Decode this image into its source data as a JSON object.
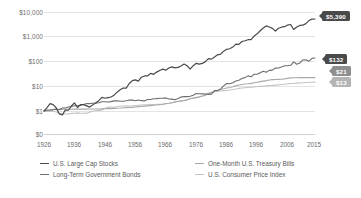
{
  "chart_data": {
    "type": "line",
    "title": "",
    "subtitle": "",
    "xlabel": "",
    "ylabel": "",
    "scale": "log",
    "ylim": [
      1,
      10000
    ],
    "xlim": [
      1926,
      2015
    ],
    "grid": true,
    "legend_position": "bottom",
    "y_ticks": [
      {
        "label": "$10,000",
        "value": 10000
      },
      {
        "label": "$1,000",
        "value": 1000
      },
      {
        "label": "$100",
        "value": 100
      },
      {
        "label": "$10",
        "value": 10
      },
      {
        "label": "$1",
        "value": 1
      },
      {
        "label": "$0",
        "value": 0
      }
    ],
    "x_ticks": [
      "1926",
      "1936",
      "1946",
      "1956",
      "1966",
      "1976",
      "1986",
      "1996",
      "2006",
      "2015"
    ],
    "x": [
      1926,
      1927,
      1928,
      1929,
      1930,
      1931,
      1932,
      1933,
      1934,
      1935,
      1936,
      1937,
      1938,
      1939,
      1940,
      1941,
      1942,
      1943,
      1944,
      1945,
      1946,
      1947,
      1948,
      1949,
      1950,
      1951,
      1952,
      1953,
      1954,
      1955,
      1956,
      1957,
      1958,
      1959,
      1960,
      1961,
      1962,
      1963,
      1964,
      1965,
      1966,
      1967,
      1968,
      1969,
      1970,
      1971,
      1972,
      1973,
      1974,
      1975,
      1976,
      1977,
      1978,
      1979,
      1980,
      1981,
      1982,
      1983,
      1984,
      1985,
      1986,
      1987,
      1988,
      1989,
      1990,
      1991,
      1992,
      1993,
      1994,
      1995,
      1996,
      1997,
      1998,
      1999,
      2000,
      2001,
      2002,
      2003,
      2004,
      2005,
      2006,
      2007,
      2008,
      2009,
      2010,
      2011,
      2012,
      2013,
      2014,
      2015
    ],
    "series": [
      {
        "name": "U.S. Large Cap Stocks",
        "color": "#4a4a4a",
        "end_value": 5390,
        "end_label": "$5,390",
        "values": [
          1,
          1.37,
          1.96,
          1.8,
          1.35,
          0.77,
          0.7,
          1.08,
          1.07,
          1.58,
          2.12,
          1.38,
          1.8,
          1.79,
          1.61,
          1.43,
          1.72,
          2.16,
          2.59,
          3.53,
          3.24,
          3.43,
          3.62,
          4.3,
          5.66,
          7.02,
          8.31,
          8.23,
          12.55,
          16.51,
          17.59,
          15.69,
          22.49,
          25.18,
          25.3,
          32.1,
          29.3,
          35.99,
          41.94,
          47.19,
          42.43,
          52.59,
          58.38,
          53.42,
          55.55,
          63.5,
          75.56,
          64.47,
          47.39,
          65.04,
          80.55,
          74.79,
          79.7,
          94.4,
          125.03,
          118.87,
          144.46,
          177.09,
          188.27,
          248.01,
          294.17,
          309.61,
          360.96,
          475.23,
          460.42,
          600.73,
          646.5,
          711.35,
          720.59,
          991.08,
          1218.54,
          1625.03,
          2089.4,
          2528.16,
          2298.03,
          2024.93,
          1577.62,
          2030.63,
          2251.63,
          2362.15,
          2735.28,
          2885.44,
          1817.83,
          2298.45,
          2644.27,
          2700.88,
          3132.93,
          4145.9,
          4712.33,
          4777.71
        ]
      },
      {
        "name": "Long-Term Government Bonds",
        "color": "#6e6e6e",
        "end_value": 132,
        "end_label": "$132",
        "values": [
          1,
          1.09,
          1.1,
          1.14,
          1.19,
          1.13,
          1.32,
          1.32,
          1.45,
          1.52,
          1.63,
          1.63,
          1.72,
          1.82,
          1.99,
          1.97,
          2.03,
          2.07,
          2.13,
          2.36,
          2.36,
          2.3,
          2.38,
          2.54,
          2.54,
          2.44,
          2.47,
          2.56,
          2.76,
          2.72,
          2.57,
          2.75,
          2.59,
          2.53,
          2.87,
          2.9,
          3.1,
          3.14,
          3.25,
          3.23,
          3.34,
          3.03,
          2.99,
          2.83,
          3.17,
          3.6,
          3.81,
          3.75,
          3.92,
          4.27,
          4.98,
          4.92,
          4.86,
          4.81,
          4.62,
          4.71,
          6.58,
          6.61,
          7.68,
          10.11,
          12.61,
          12.28,
          13.53,
          15.84,
          16.87,
          19.97,
          21.6,
          25.38,
          23.29,
          29.43,
          29.31,
          34.05,
          38.93,
          35.48,
          42.25,
          43.16,
          52.09,
          52.53,
          57.78,
          64.26,
          64.38,
          67.32,
          92.59,
          74.17,
          83.07,
          110.0,
          112.2,
          98.73,
          127.3,
          131.88
        ]
      },
      {
        "name": "One-Month U.S. Treasury Bills",
        "color": "#a8a8a8",
        "end_value": 21,
        "end_label": "$21",
        "values": [
          1,
          1.03,
          1.07,
          1.12,
          1.15,
          1.16,
          1.17,
          1.18,
          1.18,
          1.18,
          1.19,
          1.19,
          1.19,
          1.19,
          1.19,
          1.2,
          1.2,
          1.21,
          1.21,
          1.22,
          1.23,
          1.24,
          1.25,
          1.27,
          1.29,
          1.31,
          1.34,
          1.37,
          1.38,
          1.4,
          1.44,
          1.49,
          1.51,
          1.56,
          1.6,
          1.64,
          1.69,
          1.74,
          1.8,
          1.87,
          1.96,
          2.04,
          2.15,
          2.29,
          2.44,
          2.55,
          2.65,
          2.84,
          3.07,
          3.26,
          3.42,
          3.6,
          3.86,
          4.27,
          4.75,
          5.46,
          6.04,
          6.57,
          7.22,
          7.79,
          8.27,
          8.72,
          9.34,
          10.13,
          10.93,
          11.54,
          11.94,
          12.28,
          12.77,
          13.48,
          14.18,
          14.92,
          15.64,
          16.38,
          17.35,
          18.0,
          18.29,
          18.47,
          18.71,
          19.27,
          20.21,
          21.16,
          21.48,
          21.5,
          21.53,
          21.55,
          21.58,
          21.6,
          21.62,
          21.64
        ]
      },
      {
        "name": "U.S. Consumer Price Index",
        "color": "#c4c4c4",
        "end_value": 13,
        "end_label": "$13",
        "values": [
          1,
          0.98,
          0.97,
          0.97,
          0.91,
          0.83,
          0.76,
          0.76,
          0.77,
          0.8,
          0.81,
          0.84,
          0.81,
          0.81,
          0.82,
          0.9,
          1.0,
          1.03,
          1.06,
          1.08,
          1.28,
          1.4,
          1.44,
          1.41,
          1.49,
          1.58,
          1.59,
          1.6,
          1.59,
          1.6,
          1.65,
          1.7,
          1.73,
          1.76,
          1.78,
          1.8,
          1.82,
          1.85,
          1.87,
          1.91,
          1.97,
          2.03,
          2.13,
          2.26,
          2.39,
          2.47,
          2.56,
          2.78,
          3.12,
          3.34,
          3.5,
          3.74,
          4.07,
          4.61,
          5.19,
          5.65,
          5.86,
          6.08,
          6.32,
          6.56,
          6.63,
          6.92,
          7.22,
          7.56,
          8.03,
          8.27,
          8.51,
          8.74,
          8.97,
          9.2,
          9.51,
          9.67,
          9.83,
          10.1,
          10.44,
          10.6,
          10.86,
          11.07,
          11.43,
          11.82,
          12.12,
          12.62,
          12.62,
          13.0,
          13.19,
          13.58,
          13.82,
          14.03,
          14.14,
          14.24
        ]
      }
    ],
    "end_labels": [
      {
        "name": "U.S. Large Cap Stocks",
        "text": "$5,390",
        "style": "badge-dark"
      },
      {
        "name": "Long-Term Government Bonds",
        "text": "$132",
        "style": "badge-dark"
      },
      {
        "name": "One-Month U.S. Treasury Bills",
        "text": "$21",
        "style": "badge-mid"
      },
      {
        "name": "U.S. Consumer Price Index",
        "text": "$13",
        "style": "badge-light"
      }
    ],
    "legend": [
      {
        "label": "U.S. Large Cap Stocks",
        "color": "#4a4a4a"
      },
      {
        "label": "Long-Term Government Bonds",
        "color": "#6e6e6e"
      },
      {
        "label": "One-Month U.S. Treasury Bills",
        "color": "#a8a8a8"
      },
      {
        "label": "U.S. Consumer Price Index",
        "color": "#c4c4c4"
      }
    ]
  }
}
